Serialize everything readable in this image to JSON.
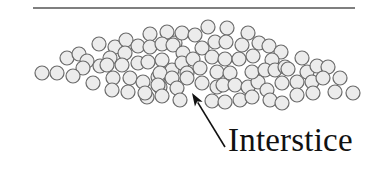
{
  "diagram": {
    "title": "",
    "label": "Interstice",
    "colors": {
      "background": "#ffffff",
      "particle_fill": "#ececec",
      "particle_stroke": "#6a6a6a",
      "line": "#555555",
      "arrow": "#111111",
      "text": "#111111"
    },
    "top_line": {
      "x1": 33,
      "y1": 8,
      "x2": 355,
      "y2": 8
    },
    "arrow": {
      "tip_x": 192,
      "tip_y": 93,
      "tail_x": 225,
      "tail_y": 147
    },
    "particle_radius": 7,
    "particles": [
      [
        42,
        73
      ],
      [
        57,
        73
      ],
      [
        67,
        58
      ],
      [
        79,
        54
      ],
      [
        87,
        61
      ],
      [
        83,
        68
      ],
      [
        73,
        76
      ],
      [
        93,
        83
      ],
      [
        99,
        44
      ],
      [
        115,
        47
      ],
      [
        126,
        40
      ],
      [
        138,
        46
      ],
      [
        150,
        34
      ],
      [
        167,
        32
      ],
      [
        150,
        47
      ],
      [
        162,
        44
      ],
      [
        175,
        43
      ],
      [
        110,
        58
      ],
      [
        125,
        53
      ],
      [
        100,
        66
      ],
      [
        107,
        65
      ],
      [
        122,
        65
      ],
      [
        138,
        63
      ],
      [
        148,
        62
      ],
      [
        162,
        60
      ],
      [
        113,
        78
      ],
      [
        130,
        78
      ],
      [
        143,
        82
      ],
      [
        158,
        77
      ],
      [
        112,
        90
      ],
      [
        128,
        92
      ],
      [
        147,
        97
      ],
      [
        160,
        87
      ],
      [
        182,
        33
      ],
      [
        195,
        35
      ],
      [
        208,
        27
      ],
      [
        227,
        28
      ],
      [
        248,
        33
      ],
      [
        173,
        45
      ],
      [
        183,
        53
      ],
      [
        202,
        48
      ],
      [
        212,
        57
      ],
      [
        215,
        42
      ],
      [
        226,
        42
      ],
      [
        242,
        45
      ],
      [
        259,
        43
      ],
      [
        269,
        46
      ],
      [
        281,
        52
      ],
      [
        172,
        70
      ],
      [
        182,
        63
      ],
      [
        193,
        59
      ],
      [
        187,
        73
      ],
      [
        200,
        68
      ],
      [
        160,
        73
      ],
      [
        172,
        78
      ],
      [
        187,
        78
      ],
      [
        202,
        83
      ],
      [
        217,
        72
      ],
      [
        230,
        73
      ],
      [
        225,
        59
      ],
      [
        239,
        59
      ],
      [
        253,
        56
      ],
      [
        272,
        60
      ],
      [
        158,
        85
      ],
      [
        177,
        88
      ],
      [
        180,
        100
      ],
      [
        162,
        96
      ],
      [
        145,
        93
      ],
      [
        217,
        87
      ],
      [
        223,
        85
      ],
      [
        235,
        85
      ],
      [
        248,
        87
      ],
      [
        258,
        82
      ],
      [
        267,
        90
      ],
      [
        252,
        72
      ],
      [
        265,
        70
      ],
      [
        275,
        70
      ],
      [
        212,
        101
      ],
      [
        225,
        102
      ],
      [
        240,
        100
      ],
      [
        252,
        97
      ],
      [
        270,
        100
      ],
      [
        282,
        103
      ],
      [
        282,
        83
      ],
      [
        285,
        67
      ],
      [
        288,
        69
      ],
      [
        297,
        82
      ],
      [
        302,
        58
      ],
      [
        307,
        72
      ],
      [
        312,
        82
      ],
      [
        317,
        66
      ],
      [
        328,
        67
      ],
      [
        323,
        78
      ],
      [
        340,
        78
      ],
      [
        297,
        95
      ],
      [
        313,
        93
      ],
      [
        335,
        92
      ],
      [
        353,
        93
      ]
    ]
  }
}
